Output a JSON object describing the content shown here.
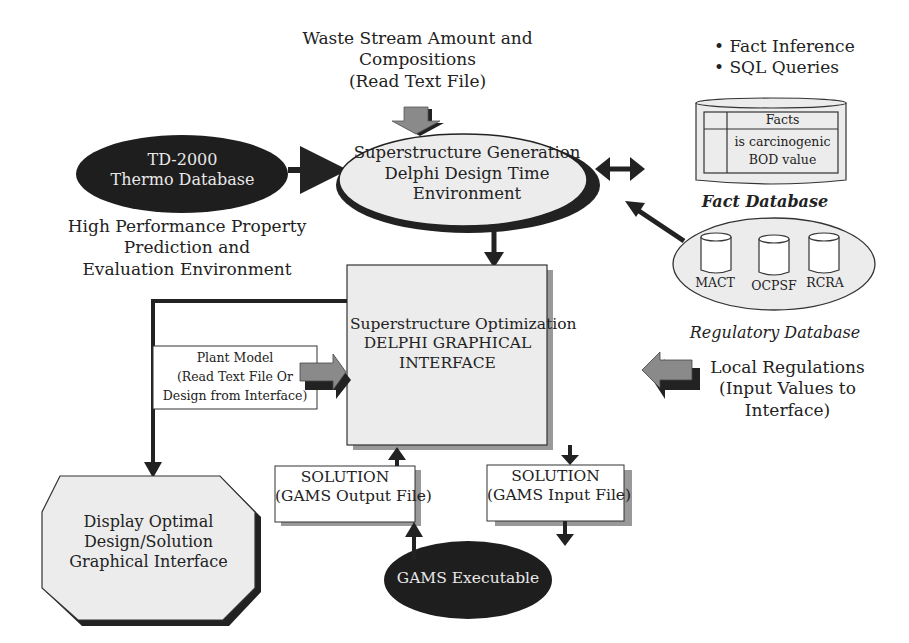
{
  "colors": {
    "dark_node": "#1e1e1e",
    "light_node": "#ececec",
    "arrow_gray": "#8a8a8a",
    "stroke": "#222222"
  },
  "waste_stream": {
    "lines": [
      "Waste Stream Amount and",
      "Compositions",
      "(Read Text File)"
    ]
  },
  "bullets": {
    "items": [
      "• Fact Inference",
      "• SQL Queries"
    ]
  },
  "td2000": {
    "lines": [
      "TD-2000",
      "Thermo Database"
    ]
  },
  "td2000_caption": {
    "lines": [
      "High Performance Property",
      "Prediction and",
      "Evaluation Environment"
    ]
  },
  "superstructure_generation": {
    "lines": [
      "Superstructure Generation",
      "Delphi Design Time",
      "Environment"
    ]
  },
  "fact_db": {
    "header": "Facts",
    "rows": [
      "is carcinogenic",
      "BOD value"
    ],
    "label": "Fact Database"
  },
  "regulatory_db": {
    "cylinders": [
      "MACT",
      "OCPSF",
      "RCRA"
    ],
    "label": "Regulatory Database"
  },
  "superstructure_optimization": {
    "lines": [
      "Superstructure Optimization",
      "DELPHI GRAPHICAL",
      "INTERFACE"
    ]
  },
  "plant_model": {
    "lines": [
      "Plant Model",
      "(Read Text File Or",
      "Design from Interface)"
    ]
  },
  "local_regulations": {
    "lines": [
      "Local Regulations",
      "(Input Values to",
      "Interface)"
    ]
  },
  "solution_output": {
    "lines": [
      "SOLUTION",
      "(GAMS Output File)"
    ]
  },
  "solution_input": {
    "lines": [
      "SOLUTION",
      "(GAMS Input File)"
    ]
  },
  "display_optimal": {
    "lines": [
      "Display Optimal",
      "Design/Solution",
      "Graphical Interface"
    ]
  },
  "gams_exec": {
    "label": "GAMS Executable"
  }
}
